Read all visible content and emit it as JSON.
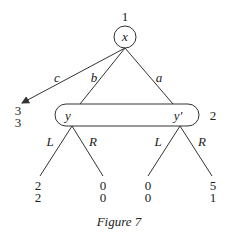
{
  "figure": {
    "caption": "Figure 7",
    "root": {
      "player": "1",
      "node_label": "x"
    },
    "edges_from_root": [
      {
        "label": "c",
        "leads_to": "terminal",
        "payoffs": [
          "3",
          "3"
        ]
      },
      {
        "label": "b",
        "leads_to": "y"
      },
      {
        "label": "a",
        "leads_to": "y'"
      }
    ],
    "information_set": {
      "player": "2",
      "nodes": [
        "y",
        "y'"
      ]
    },
    "subtrees": [
      {
        "node": "y",
        "actions": [
          {
            "label": "L",
            "payoffs": [
              "2",
              "2"
            ]
          },
          {
            "label": "R",
            "payoffs": [
              "0",
              "0"
            ]
          }
        ]
      },
      {
        "node": "y'",
        "actions": [
          {
            "label": "L",
            "payoffs": [
              "0",
              "0"
            ]
          },
          {
            "label": "R",
            "payoffs": [
              "5",
              "1"
            ]
          }
        ]
      }
    ]
  },
  "colors": {
    "stroke": "#333333",
    "text": "#222222",
    "background": "#ffffff"
  }
}
